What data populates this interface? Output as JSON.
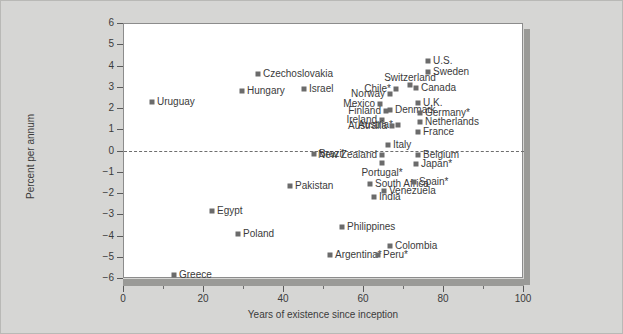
{
  "chart_data": {
    "type": "scatter",
    "title": "",
    "xlabel": "Years of existence since inception",
    "ylabel": "Percent per annum",
    "xlim": [
      0,
      100
    ],
    "ylim": [
      -6,
      6
    ],
    "xticks": [
      0,
      20,
      40,
      60,
      80,
      100
    ],
    "yticks": [
      6,
      5,
      4,
      3,
      2,
      1,
      0,
      -1,
      -2,
      -3,
      -4,
      -5,
      -6
    ],
    "grid": false,
    "legend": "none",
    "annotations": [
      {
        "name": "zero-reference-line",
        "y": 0,
        "style": "dashed"
      }
    ],
    "note": "* marks countries with an asterisk in the label",
    "points": [
      {
        "label": "U.S.",
        "x": 76.0,
        "y": 4.25,
        "pos": "right"
      },
      {
        "label": "Sweden",
        "x": 76.0,
        "y": 3.75,
        "pos": "right"
      },
      {
        "label": "Switzerland",
        "x": 71.5,
        "y": 3.15,
        "pos": "above"
      },
      {
        "label": "Canada",
        "x": 73.0,
        "y": 3.0,
        "pos": "right"
      },
      {
        "label": "Chile*",
        "x": 68.0,
        "y": 2.95,
        "pos": "left"
      },
      {
        "label": "Norway",
        "x": 66.5,
        "y": 2.7,
        "pos": "left"
      },
      {
        "label": "U.K.",
        "x": 73.5,
        "y": 2.3,
        "pos": "right"
      },
      {
        "label": "Mexico",
        "x": 64.0,
        "y": 2.25,
        "pos": "left"
      },
      {
        "label": "Denmark",
        "x": 66.5,
        "y": 1.95,
        "pos": "right"
      },
      {
        "label": "Finland",
        "x": 65.5,
        "y": 1.9,
        "pos": "left"
      },
      {
        "label": "Germany*",
        "x": 74.0,
        "y": 1.8,
        "pos": "right"
      },
      {
        "label": "Ireland",
        "x": 64.5,
        "y": 1.5,
        "pos": "left"
      },
      {
        "label": "Netherlands",
        "x": 74.0,
        "y": 1.4,
        "pos": "right"
      },
      {
        "label": "Austria*",
        "x": 68.5,
        "y": 1.25,
        "pos": "left"
      },
      {
        "label": "Australia",
        "x": 67.0,
        "y": 1.2,
        "pos": "left"
      },
      {
        "label": "France",
        "x": 73.5,
        "y": 0.9,
        "pos": "right"
      },
      {
        "label": "Italy",
        "x": 66.0,
        "y": 0.3,
        "pos": "right"
      },
      {
        "label": "Belgium",
        "x": 73.5,
        "y": -0.15,
        "pos": "right"
      },
      {
        "label": "New Zealand",
        "x": 64.5,
        "y": -0.15,
        "pos": "left"
      },
      {
        "label": "Brazil",
        "x": 47.5,
        "y": -0.1,
        "pos": "right"
      },
      {
        "label": "Japan*",
        "x": 73.0,
        "y": -0.6,
        "pos": "right"
      },
      {
        "label": "Portugal*",
        "x": 64.5,
        "y": -0.55,
        "pos": "below"
      },
      {
        "label": "South Africa",
        "x": 61.5,
        "y": -1.55,
        "pos": "right"
      },
      {
        "label": "Spain*",
        "x": 72.5,
        "y": -1.45,
        "pos": "right"
      },
      {
        "label": "Pakistan",
        "x": 41.5,
        "y": -1.6,
        "pos": "right"
      },
      {
        "label": "Venezuela",
        "x": 65.0,
        "y": -1.85,
        "pos": "right"
      },
      {
        "label": "India",
        "x": 62.5,
        "y": -2.15,
        "pos": "right"
      },
      {
        "label": "Egypt",
        "x": 22.0,
        "y": -2.8,
        "pos": "right"
      },
      {
        "label": "Philippines",
        "x": 54.5,
        "y": -3.55,
        "pos": "right"
      },
      {
        "label": "Poland",
        "x": 28.5,
        "y": -3.9,
        "pos": "right"
      },
      {
        "label": "Colombia",
        "x": 66.5,
        "y": -4.45,
        "pos": "right"
      },
      {
        "label": "Argentina*",
        "x": 51.5,
        "y": -4.85,
        "pos": "right"
      },
      {
        "label": "Peru*",
        "x": 63.5,
        "y": -4.85,
        "pos": "right"
      },
      {
        "label": "Greece",
        "x": 12.5,
        "y": -5.8,
        "pos": "right"
      },
      {
        "label": "Uruguay",
        "x": 7.0,
        "y": 2.35,
        "pos": "right"
      },
      {
        "label": "Hungary",
        "x": 29.5,
        "y": 2.85,
        "pos": "right"
      },
      {
        "label": "Czechoslovakia",
        "x": 33.5,
        "y": 3.65,
        "pos": "right"
      },
      {
        "label": "Israel",
        "x": 45.0,
        "y": 2.95,
        "pos": "right"
      }
    ]
  },
  "colors": {
    "marker": "#6b6b6b",
    "text": "#3b3b3b",
    "plot_background": "#ffffff",
    "figure_background": "#d6d6d4",
    "axis": "#5a5a5a",
    "shadow": "#9a9a97"
  }
}
